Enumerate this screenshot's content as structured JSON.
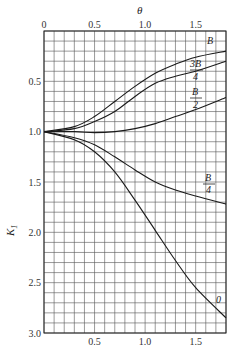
{
  "chart_data": {
    "type": "line",
    "title": "",
    "xlabel": "θ",
    "ylabel": "K1",
    "xlim": [
      0,
      1.8
    ],
    "ylim": [
      3.0,
      0
    ],
    "y_inverted": true,
    "grid": true,
    "grid_step_x": 0.1,
    "grid_step_y": 0.1,
    "x_ticks_top": [
      "0",
      "0.5",
      "1.0",
      "1.5"
    ],
    "x_ticks_bottom": [
      "0.5",
      "1.0",
      "1.5"
    ],
    "y_ticks": [
      "0.5",
      "1.0",
      "1.5",
      "2.0",
      "2.5",
      "3.0"
    ],
    "x": [
      0,
      0.3,
      0.5,
      0.7,
      0.9,
      1.1,
      1.3,
      1.5,
      1.8
    ],
    "series": [
      {
        "name": "B",
        "label": "B",
        "values": [
          1.0,
          0.95,
          0.85,
          0.7,
          0.55,
          0.42,
          0.33,
          0.26,
          0.2
        ]
      },
      {
        "name": "3B/4",
        "label": "3B/4",
        "values": [
          1.0,
          0.97,
          0.9,
          0.8,
          0.65,
          0.52,
          0.45,
          0.4,
          0.3
        ]
      },
      {
        "name": "B/2",
        "label": "B/2",
        "values": [
          1.0,
          1.0,
          1.01,
          1.0,
          0.97,
          0.92,
          0.85,
          0.78,
          0.66
        ]
      },
      {
        "name": "B/4",
        "label": "B/4",
        "values": [
          1.0,
          1.06,
          1.13,
          1.25,
          1.38,
          1.5,
          1.58,
          1.64,
          1.72
        ]
      },
      {
        "name": "0",
        "label": "0",
        "values": [
          1.0,
          1.08,
          1.2,
          1.4,
          1.68,
          1.98,
          2.28,
          2.55,
          2.85
        ]
      }
    ],
    "legend": "inline curve labels at right end"
  },
  "labels": {
    "x_axis": "θ",
    "y_axis_main": "K",
    "y_axis_sub": "1",
    "curve_B": "B",
    "curve_3B4_num": "3B",
    "curve_3B4_den": "4",
    "curve_B2_num": "B",
    "curve_B2_den": "2",
    "curve_B4_num": "B",
    "curve_B4_den": "4",
    "curve_0": "0"
  }
}
